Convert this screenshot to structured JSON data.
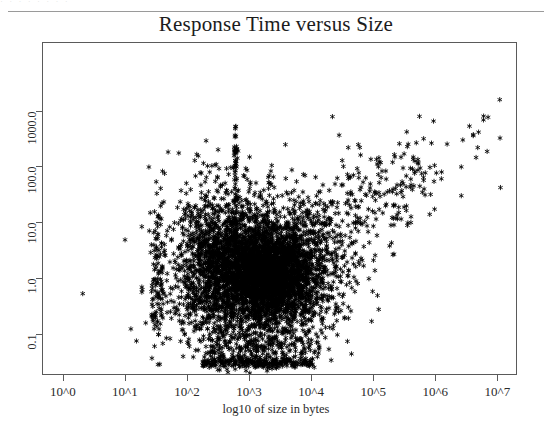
{
  "scan": {
    "fragment_text": "·  ·   ·  ·   ·  ·    ·   ·",
    "background_color": "#ffffff",
    "ink_color": "#000000",
    "axis_color": "#5a5a5a"
  },
  "chart_data": {
    "type": "scatter",
    "title": "Response Time versus Size",
    "xlabel": "log10 of size in bytes",
    "ylabel": "",
    "grid": false,
    "legend": null,
    "marker": "asterisk",
    "marker_color": "#000000",
    "x_scale": "log10",
    "y_scale": "log10",
    "xlim": [
      -0.32,
      7.3
    ],
    "ylim": [
      -1.72,
      4.21
    ],
    "x_ticks": [
      0,
      1,
      2,
      3,
      4,
      5,
      6,
      7
    ],
    "x_tick_labels": [
      "10^0",
      "10^1",
      "10^2",
      "10^3",
      "10^4",
      "10^5",
      "10^6",
      "10^7"
    ],
    "y_ticks": [
      1000.0,
      100.0,
      10.0,
      1.0,
      0.1
    ],
    "y_tick_labels": [
      "1000.0",
      "100.0",
      "10.0",
      "1.0",
      "0.1"
    ],
    "n_points_approx": 6000,
    "clusters": [
      {
        "name": "main-cloud",
        "x_center": 3.15,
        "y_center": 0.12,
        "x_sigma": 0.62,
        "y_sigma": 0.66,
        "count": 3000
      },
      {
        "name": "core-dense",
        "x_center": 3.35,
        "y_center": 0.02,
        "x_sigma": 0.34,
        "y_sigma": 0.34,
        "count": 1500
      },
      {
        "name": "left-shoulder",
        "x_center": 2.45,
        "y_center": 0.25,
        "x_sigma": 0.3,
        "y_sigma": 0.72,
        "count": 700
      },
      {
        "name": "upper-diagonal-tail",
        "x_center": 4.4,
        "y_center": 1.0,
        "x_sigma": 0.85,
        "y_sigma": 0.75,
        "count": 380
      },
      {
        "name": "far-right-outliers",
        "x_center": 6.3,
        "y_center": 2.1,
        "x_sigma": 0.55,
        "y_sigma": 0.55,
        "count": 26
      },
      {
        "name": "floor-band",
        "x_center": 3.1,
        "y_center": -1.52,
        "x_sigma": 0.55,
        "y_sigma": 0.05,
        "count": 260
      },
      {
        "name": "vertical-spike",
        "x_center": 2.78,
        "y_center": 1.3,
        "x_sigma": 0.015,
        "y_sigma": 0.85,
        "count": 90
      }
    ],
    "isolated_points": [
      {
        "x": 0.32,
        "y": -0.28
      },
      {
        "x": 1.28,
        "y": -0.21
      },
      {
        "x": 7.05,
        "y": 1.62
      },
      {
        "x": 6.85,
        "y": 2.88
      },
      {
        "x": 6.55,
        "y": 2.72
      }
    ]
  }
}
